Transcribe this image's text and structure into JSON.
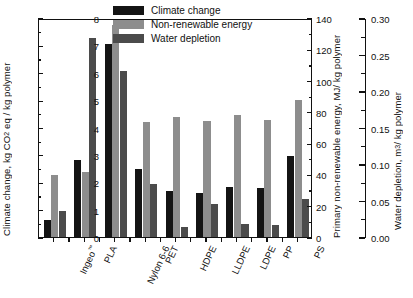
{
  "chart_data": {
    "type": "bar",
    "title": "",
    "categories": [
      "Ingeo™",
      "PLA",
      "Nylon 6-6",
      "PET",
      "HDPE",
      "LLDPE",
      "LDPE",
      "PP",
      "PS"
    ],
    "series": [
      {
        "name": "Climate change",
        "color": "#141414",
        "axis": "left",
        "unit": "kg CO2 eq / kg polymer",
        "values": [
          0.62,
          2.8,
          7.05,
          2.48,
          1.68,
          1.61,
          1.82,
          1.78,
          2.97
        ]
      },
      {
        "name": "Non-renewable energy",
        "color": "#8d8d8d",
        "axis": "right1",
        "unit": "MJ / kg polymer",
        "values": [
          39.8,
          41.5,
          135.5,
          73.3,
          76.6,
          74.2,
          78.3,
          74.8,
          87.8
        ]
      },
      {
        "name": "Water depletion",
        "color": "#4b4b4b",
        "axis": "right2",
        "unit": "m3 / kg polymer",
        "values": [
          0.0351,
          0.2723,
          0.2269,
          0.072,
          0.0139,
          0.045,
          0.018,
          0.0161,
          0.0525
        ]
      }
    ],
    "left_axis": {
      "label": "Climate change, kg CO2 eq / kg polymer",
      "min": 0,
      "max": 8,
      "ticks": [
        0,
        1,
        2,
        3,
        4,
        5,
        6,
        7,
        8
      ]
    },
    "right_axis_1": {
      "label": "Primary non-renewable energy, MJ/ kg polymer",
      "min": 0,
      "max": 140,
      "ticks": [
        0,
        20,
        40,
        60,
        80,
        100,
        120,
        140
      ]
    },
    "right_axis_2": {
      "label": "Water depletion, m3/ kg polymer",
      "min": 0,
      "max": 0.3,
      "ticks": [
        "0.00",
        "0.05",
        "0.10",
        "0.15",
        "0.20",
        "0.25",
        "0.30"
      ]
    },
    "xlabel": "",
    "grid": false,
    "legend_position": "top-center"
  },
  "legend": {
    "items": [
      {
        "label": "Climate change"
      },
      {
        "label": "Non-renewable energy"
      },
      {
        "label": "Water depletion"
      }
    ]
  },
  "axis_titles": {
    "left_pre": "Climate change, kg CO",
    "left_sub": "2",
    "left_post": " eq / kg polymer",
    "right1": "Primary non-renewable energy, MJ/ kg polymer",
    "right2_pre": "Water depletion, m",
    "right2_sup": "3",
    "right2_post": "/ kg polymer"
  }
}
